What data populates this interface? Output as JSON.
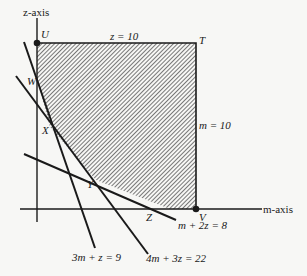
{
  "axes": {
    "z_label": "z-axis",
    "m_label": "m-axis"
  },
  "points": {
    "U": "U",
    "T": "T",
    "V": "V",
    "W": "W",
    "X": "X",
    "Y": "Y",
    "Z": "Z"
  },
  "constraints": {
    "top": "z = 10",
    "right": "m = 10",
    "line1": "3m + z = 9",
    "line2": "4m + 3z = 22",
    "line3": "m + 2z = 8"
  },
  "colors": {
    "ink": "#1a1a1a",
    "background": "#f7f7f5"
  }
}
